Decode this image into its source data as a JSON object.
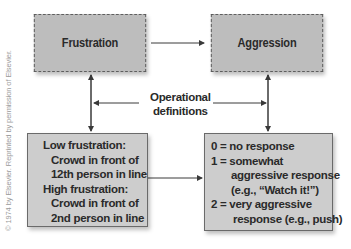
{
  "diagram": {
    "top_left_box": {
      "label": "Frustration"
    },
    "top_right_box": {
      "label": "Aggression"
    },
    "center_label": {
      "line1": "Operational",
      "line2": "definitions"
    },
    "bottom_left_box": {
      "lines": [
        "Low frustration:",
        "Crowd in front of",
        "12th person in line",
        "High frustration:",
        "Crowd in front of",
        "2nd person in line"
      ]
    },
    "bottom_right_box": {
      "lines": [
        "0 = no response",
        "1 = somewhat",
        "aggressive response",
        "(e.g., “Watch it!”)",
        "2 =  very aggressive",
        "response (e.g., push)"
      ]
    },
    "credit": "© 1974 by Elsevier. Reprinted by permission of Elsevier.",
    "colors": {
      "box_fill": "#bdbdbd",
      "line": "#3a3a3a",
      "text": "#2a2a2a"
    }
  }
}
